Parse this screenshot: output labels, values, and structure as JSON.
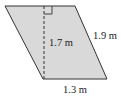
{
  "figure": {
    "shape": "parallelogram",
    "fill_color": "#d9d9d9",
    "stroke_color": "#333333",
    "labels": {
      "height": "1.7 m",
      "side": "1.9 m",
      "base": "1.3 m"
    },
    "markers": {
      "height_line": "dashed",
      "right_angle": true
    }
  }
}
